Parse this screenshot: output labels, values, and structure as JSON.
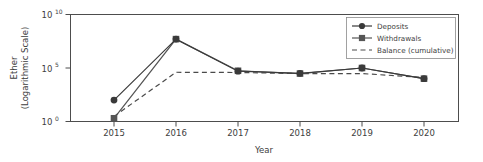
{
  "chart_data": {
    "type": "line",
    "title": "",
    "xlabel": "Year",
    "ylabel": "Ether\n(Logarithmic Scale)",
    "ylabel_line1": "Ether",
    "ylabel_line2": "(Logarithmic Scale)",
    "yscale": "log",
    "ylim": [
      1,
      10000000000
    ],
    "ytick_labels": [
      "10",
      "10",
      "10"
    ],
    "ytick_exponents": [
      "10",
      "5",
      "0"
    ],
    "ytick_values": [
      10000000000,
      100000,
      1
    ],
    "grid": false,
    "legend_position": "upper right",
    "categories": [
      2015,
      2016,
      2017,
      2018,
      2019,
      2020
    ],
    "x_tick_labels": [
      "2015",
      "2016",
      "2017",
      "2018",
      "2019",
      "2020"
    ],
    "series": [
      {
        "name": "Deposits",
        "marker": "circle",
        "linestyle": "solid",
        "color": "#3a3a3a",
        "values": [
          100,
          50000000,
          50000,
          32000,
          100000,
          10000
        ]
      },
      {
        "name": "Withdrawals",
        "marker": "square",
        "linestyle": "solid",
        "color": "#555555",
        "values": [
          2,
          50000000,
          55000,
          30000,
          100000,
          10000
        ]
      },
      {
        "name": "Balance (cumulative)",
        "marker": "none",
        "linestyle": "dashed",
        "color": "#4a4a4a",
        "values": [
          3,
          40000,
          38000,
          30000,
          30000,
          13000
        ]
      }
    ]
  },
  "legend": {
    "entries": [
      {
        "label": "Deposits"
      },
      {
        "label": "Withdrawals"
      },
      {
        "label": "Balance (cumulative)"
      }
    ]
  },
  "colors": {
    "axis": "#4d4d4d",
    "text": "#3d3d3d",
    "deposits": "#3a3a3a",
    "withdrawals": "#555555",
    "balance": "#4a4a4a",
    "background": "#ffffff"
  }
}
